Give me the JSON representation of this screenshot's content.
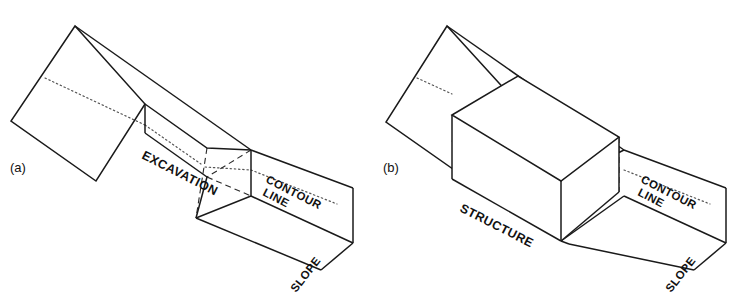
{
  "figure": {
    "width": 752,
    "height": 307,
    "background": "#ffffff",
    "line_color": "#1a1a1a",
    "dotted_color": "#555555",
    "dashed_color": "#2a2a2a"
  },
  "panels": [
    {
      "id": "a",
      "label": "(a)",
      "label_pos": {
        "x": 10,
        "y": 172
      },
      "annotations": [
        {
          "name": "excavation",
          "text": "EXCAVATION",
          "x": 141,
          "y": 158,
          "rotation": 27
        },
        {
          "name": "contour-line-1",
          "text": "CONTOUR",
          "x": 265,
          "y": 182,
          "rotation": 27
        },
        {
          "name": "contour-line-2",
          "text": "LINE",
          "x": 262,
          "y": 195,
          "rotation": 27
        },
        {
          "name": "slope",
          "text": "SLOPE",
          "x": 296,
          "y": 293,
          "rotation": -52
        }
      ]
    },
    {
      "id": "b",
      "label": "(b)",
      "label_pos": {
        "x": 383,
        "y": 172
      },
      "annotations": [
        {
          "name": "structure",
          "text": "STRUCTURE",
          "x": 459,
          "y": 211,
          "rotation": 27
        },
        {
          "name": "contour-line-1",
          "text": "CONTOUR",
          "x": 640,
          "y": 182,
          "rotation": 27
        },
        {
          "name": "contour-line-2",
          "text": "LINE",
          "x": 637,
          "y": 195,
          "rotation": 27
        },
        {
          "name": "slope",
          "text": "SLOPE",
          "x": 671,
          "y": 293,
          "rotation": -52
        }
      ]
    }
  ],
  "geometry": {
    "panel_a": {
      "terrace_top_face": "M 75,26 L 11,121 L 96,181 L 145,104 Z",
      "crest_ridge": "M 75,26 L 251,150",
      "crest_to_notch": "M 145,104 L 207,148",
      "left_end_upper": "M 75,26 L 11,121",
      "left_end_lower": "M 11,121 L 96,181",
      "front_slope_left": "M 96,181 L 145,104",
      "notch_vertical": "M 145,104 L 145,133",
      "notch_front_bottom": "M 145,133 L 207,177",
      "notch_far_edge": "M 207,148 L 251,150",
      "notch_right_wall": "M 251,150 L 251,196",
      "notch_bottom_right": "M 207,177 L 251,196",
      "notch_floor_to_toe": "M 207,177 L 196,218",
      "notch_toe_to_right": "M 196,218 L 251,196",
      "slope_face_top": "M 251,150 L 353,188",
      "right_end_vertical": "M 353,188 L 353,243",
      "right_toe_edge": "M 353,243 L 321,270",
      "slope_toe_line": "M 196,218 L 321,270",
      "slope_right_edge": "M 251,196 L 353,243",
      "contour_dotted": "M 45,78 L 145,125 L 207,168 L 251,170 L 332,202",
      "hidden_dashed": "M 207,148 L 196,218 M 251,150 L 207,177 M 207,177 L 251,196"
    },
    "panel_b": {
      "terrace_top_face": "M 447,26 L 386,122 L 470,181 L 518,104 Z",
      "crest_ridge": "M 447,26 L 624,150",
      "left_end_upper": "M 447,26 L 386,122",
      "left_end_lower": "M 386,122 L 470,181",
      "box_top_face": "M 452,115 L 518,76 L 619,137 L 561,181 Z",
      "box_front_left_vertical": "M 452,115 L 452,179",
      "box_front_mid_vertical": "M 561,181 L 561,241",
      "box_right_vertical": "M 619,137 L 619,192",
      "box_bottom_front": "M 452,179 L 561,241",
      "box_bottom_right": "M 561,241 L 619,192",
      "box_hidden_vertical": "M 518,76 L 518,140",
      "slope_face_top": "M 624,150 L 726,188",
      "right_end_vertical": "M 726,188 L 726,243",
      "right_toe_edge": "M 726,243 L 694,270",
      "slope_toe_line": "M 569,244 L 694,270",
      "slope_right_edge": "M 624,196 L 726,243",
      "contour_dotted": "M 417,78 L 452,94 L 518,140 L 561,142 L 619,166 L 705,202",
      "hidden_dashed_ridge": "M 518,76 L 518,140 M 452,152 L 518,140 L 561,181 M 561,181 L 624,150 M 561,181 L 619,192"
    }
  }
}
